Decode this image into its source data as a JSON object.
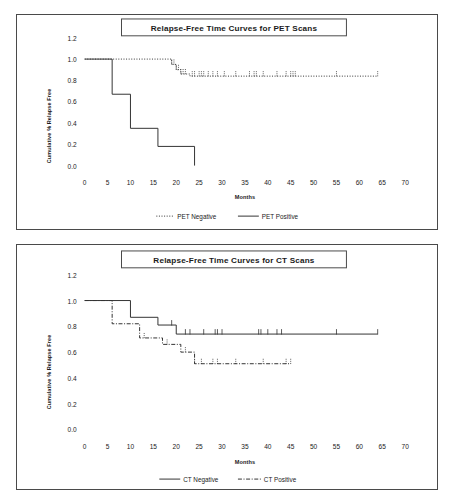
{
  "document": {
    "kind": "figure-pair",
    "background_color": "#ffffff",
    "line_color": "#333333",
    "frame_color": "#4a4a4a"
  },
  "charts": [
    {
      "id": "pet",
      "title": "Relapse-Free Time Curves for PET Scans",
      "xlabel": "Months",
      "ylabel": "Cumulative % Relapse Free",
      "legend": [
        {
          "label": "PET Negative",
          "style": "dotted"
        },
        {
          "label": "PET Positive",
          "style": "solid"
        }
      ],
      "y_ticks": [
        "0.0",
        "0.2",
        "0.4",
        "0.6",
        "0.8",
        "1.0",
        "1.2"
      ],
      "x_ticks": [
        "0",
        "5",
        "10",
        "15",
        "20",
        "25",
        "30",
        "35",
        "40",
        "45",
        "50",
        "55",
        "60",
        "65",
        "70"
      ]
    },
    {
      "id": "ct",
      "title": "Relapse-Free Time Curves for CT Scans",
      "xlabel": "Months",
      "ylabel": "Cumulative % Relapse Free",
      "legend": [
        {
          "label": "CT Negative",
          "style": "solid"
        },
        {
          "label": "CT Positive",
          "style": "dashdot"
        }
      ],
      "y_ticks": [
        "0.0",
        "0.2",
        "0.4",
        "0.6",
        "0.8",
        "1.0",
        "1.2"
      ],
      "x_ticks": [
        "0",
        "5",
        "10",
        "15",
        "20",
        "25",
        "30",
        "35",
        "40",
        "45",
        "50",
        "55",
        "60",
        "65",
        "70"
      ]
    }
  ],
  "chart_data": [
    {
      "type": "line",
      "subtype": "kaplan-meier-step",
      "title": "Relapse-Free Time Curves for PET Scans",
      "xlabel": "Months",
      "ylabel": "Cumulative % Relapse Free",
      "xlim": [
        0,
        70
      ],
      "ylim": [
        0.0,
        1.2
      ],
      "grid": false,
      "legend_position": "bottom",
      "series": [
        {
          "name": "PET Negative",
          "style": "dotted",
          "steps": [
            [
              0,
              1.0
            ],
            [
              6,
              1.0
            ],
            [
              6,
              1.0
            ],
            [
              19,
              1.0
            ],
            [
              19,
              0.95
            ],
            [
              20,
              0.95
            ],
            [
              20,
              0.9
            ],
            [
              21,
              0.9
            ],
            [
              21,
              0.86
            ],
            [
              23,
              0.86
            ],
            [
              23,
              0.84
            ],
            [
              64,
              0.84
            ]
          ],
          "censor_months": [
            19,
            19.5,
            20,
            20.5,
            21,
            21.5,
            22,
            23.5,
            24,
            25,
            25.5,
            26,
            27,
            28,
            29,
            30.5,
            33,
            36,
            37,
            37.5,
            39,
            42,
            44,
            45,
            45.5,
            46,
            55,
            64
          ]
        },
        {
          "name": "PET Positive",
          "style": "solid",
          "steps": [
            [
              0,
              1.0
            ],
            [
              6,
              1.0
            ],
            [
              6,
              0.67
            ],
            [
              10,
              0.67
            ],
            [
              10,
              0.35
            ],
            [
              16,
              0.35
            ],
            [
              16,
              0.18
            ],
            [
              24,
              0.18
            ],
            [
              24,
              0.0
            ]
          ],
          "censor_months": []
        }
      ]
    },
    {
      "type": "line",
      "subtype": "kaplan-meier-step",
      "title": "Relapse-Free Time Curves for CT Scans",
      "xlabel": "Months",
      "ylabel": "Cumulative % Relapse Free",
      "xlim": [
        0,
        70
      ],
      "ylim": [
        0.0,
        1.2
      ],
      "grid": false,
      "legend_position": "bottom",
      "series": [
        {
          "name": "CT Negative",
          "style": "solid",
          "steps": [
            [
              0,
              1.0
            ],
            [
              10,
              1.0
            ],
            [
              10,
              0.87
            ],
            [
              16,
              0.87
            ],
            [
              16,
              0.81
            ],
            [
              20,
              0.81
            ],
            [
              20,
              0.74
            ],
            [
              64,
              0.74
            ]
          ],
          "censor_months": [
            19,
            22,
            23,
            26,
            28.5,
            29,
            30,
            38,
            38.5,
            40,
            42,
            43,
            55,
            64
          ]
        },
        {
          "name": "CT Positive",
          "style": "dashdot",
          "steps": [
            [
              0,
              1.0
            ],
            [
              6,
              1.0
            ],
            [
              6,
              0.82
            ],
            [
              12,
              0.82
            ],
            [
              12,
              0.71
            ],
            [
              17,
              0.71
            ],
            [
              17,
              0.66
            ],
            [
              21,
              0.66
            ],
            [
              21,
              0.6
            ],
            [
              24,
              0.6
            ],
            [
              24,
              0.51
            ],
            [
              45,
              0.51
            ]
          ],
          "censor_months": [
            13,
            18,
            22,
            24,
            25.5,
            28,
            29,
            33,
            39,
            44,
            45
          ]
        }
      ]
    }
  ]
}
